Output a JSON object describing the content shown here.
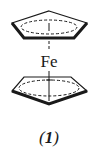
{
  "diagram": {
    "type": "chemical-structure",
    "molecule": "ferrocene",
    "metal_label": "Fe",
    "compound_label_open": "(",
    "compound_number": "1",
    "compound_label_close": ")",
    "colors": {
      "stroke": "#1a1a1a",
      "background": "#ffffff"
    }
  }
}
